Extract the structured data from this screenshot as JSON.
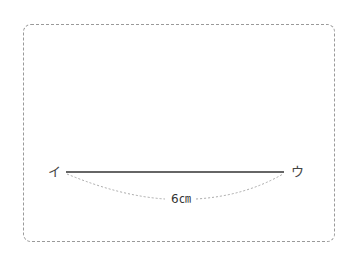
{
  "diagram": {
    "frame": {
      "style": "dashed-rounded-border",
      "color": "#9a9a9a"
    },
    "segment": {
      "start_label": "イ",
      "end_label": "ウ",
      "length_label": "6㎝",
      "line_color": "#333333",
      "arc_color": "#aaaaaa"
    }
  }
}
